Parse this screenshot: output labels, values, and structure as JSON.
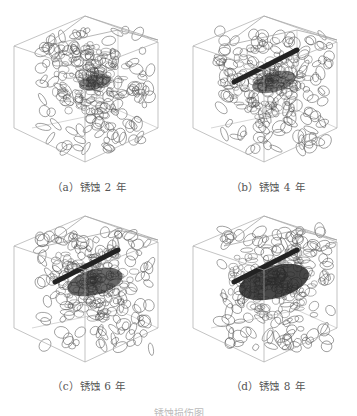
{
  "figure": {
    "panels": [
      {
        "id": "a",
        "caption": "（a）锈蚀 2 年",
        "corrosion_years": 2,
        "crack_size": 0.15
      },
      {
        "id": "b",
        "caption": "（b）锈蚀 4 年",
        "corrosion_years": 4,
        "crack_size": 0.35
      },
      {
        "id": "c",
        "caption": "（c）锈蚀 6 年",
        "corrosion_years": 6,
        "crack_size": 0.55
      },
      {
        "id": "d",
        "caption": "（d）锈蚀 8 年",
        "corrosion_years": 8,
        "crack_size": 0.8
      }
    ],
    "main_caption": "锈蚀损伤图"
  }
}
